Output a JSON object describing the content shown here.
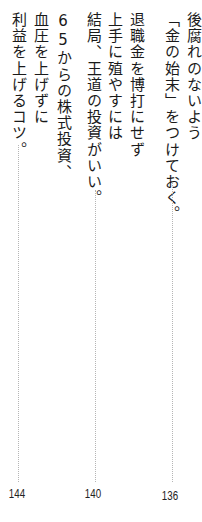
{
  "toc": {
    "entries": [
      {
        "lines": [
          "後腐れのないよう",
          "「金の始末」をつけておく。"
        ],
        "page": "136"
      },
      {
        "lines": [
          "退職金を博打にせず",
          "上手に殖やすには",
          "結局、王道の投資がいい。"
        ],
        "page": "140"
      },
      {
        "lines": [
          "65からの株式投資、",
          "血圧を上げずに",
          "利益を上げるコツ。"
        ],
        "page": "144"
      }
    ]
  }
}
